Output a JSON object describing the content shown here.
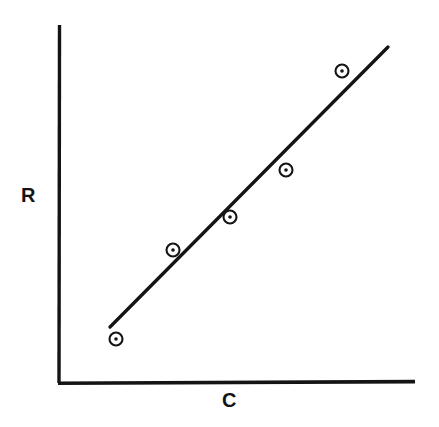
{
  "figure": {
    "background_color": "#ffffff",
    "ink_color": "#141414"
  },
  "labels": {
    "y_axis": "R",
    "x_axis": "C"
  },
  "chart_data": {
    "type": "scatter",
    "title": "",
    "xlabel": "C",
    "ylabel": "R",
    "grid": false,
    "legend": false,
    "axes": {
      "x_axis_drawn": true,
      "y_axis_drawn": true,
      "x_ticks": [],
      "y_ticks": [],
      "xlim": [
        0,
        1
      ],
      "ylim": [
        0,
        1
      ],
      "note": "Schematic plot: axes are unlabeled with no tick marks or numeric scale."
    },
    "series": [
      {
        "name": "observations",
        "type": "scatter",
        "marker": "bullseye-circle",
        "x": [
          0.16,
          0.32,
          0.48,
          0.64,
          0.79
        ],
        "y": [
          0.12,
          0.37,
          0.46,
          0.59,
          0.87
        ]
      },
      {
        "name": "fitted-line",
        "type": "line",
        "x": [
          0.145,
          0.92
        ],
        "y": [
          0.155,
          0.935
        ]
      }
    ],
    "pixel_geometry": {
      "y_axis": {
        "x": 59,
        "y_top": 25,
        "y_bottom": 383
      },
      "x_axis": {
        "y": 383,
        "x_left": 58,
        "x_right": 415
      },
      "points_px": [
        {
          "cx": 116,
          "cy": 339
        },
        {
          "cx": 173,
          "cy": 250
        },
        {
          "cx": 230,
          "cy": 217
        },
        {
          "cx": 286,
          "cy": 170
        },
        {
          "cx": 342,
          "cy": 71
        }
      ],
      "marker_outer_radius": 6.5,
      "marker_inner_radius": 1.8,
      "line_px": {
        "x1": 110,
        "y1": 327,
        "x2": 388,
        "y2": 47
      }
    }
  }
}
